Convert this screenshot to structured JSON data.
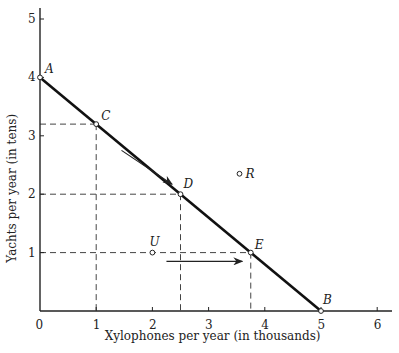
{
  "chart_data": {
    "type": "line",
    "title": "",
    "xlabel": "Xylophones per year (in thousands)",
    "ylabel": "Yachts per year (in tens)",
    "xlim": [
      0,
      6.3
    ],
    "ylim": [
      0,
      5.3
    ],
    "x_ticks": [
      "0",
      "1",
      "2",
      "3",
      "4",
      "5",
      "6"
    ],
    "y_ticks": [
      "1",
      "2",
      "3",
      "4",
      "5"
    ],
    "grid": false,
    "series": [
      {
        "name": "Production possibility frontier",
        "x": [
          0,
          5
        ],
        "y": [
          4,
          0
        ]
      }
    ],
    "points": [
      {
        "label": "A",
        "x": 0,
        "y": 4
      },
      {
        "label": "C",
        "x": 1,
        "y": 3.2
      },
      {
        "label": "D",
        "x": 2.5,
        "y": 2
      },
      {
        "label": "E",
        "x": 3.75,
        "y": 1
      },
      {
        "label": "B",
        "x": 5,
        "y": 0
      },
      {
        "label": "R",
        "x": 3.55,
        "y": 2.35
      },
      {
        "label": "U",
        "x": 2,
        "y": 1
      }
    ],
    "guide_lines": [
      {
        "point": "C",
        "x": 1,
        "y": 3.2
      },
      {
        "point": "D",
        "x": 2.5,
        "y": 2
      },
      {
        "point": "E",
        "x": 3.75,
        "y": 1
      }
    ],
    "annotations": [
      {
        "type": "arrow",
        "description": "arrow along frontier from C toward D",
        "from": [
          1.45,
          2.75
        ],
        "to": [
          2.35,
          2.17
        ]
      },
      {
        "type": "arrow",
        "description": "horizontal arrow from U toward E",
        "from": [
          2.25,
          0.85
        ],
        "to": [
          3.6,
          0.85
        ]
      }
    ]
  }
}
